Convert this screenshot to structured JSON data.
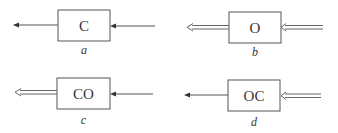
{
  "diagram": {
    "panels": [
      {
        "id": "a",
        "box_text": "C",
        "caption": "a",
        "output_arrow": "single",
        "input_arrow": "single"
      },
      {
        "id": "b",
        "box_text": "O",
        "caption": "b",
        "output_arrow": "double",
        "input_arrow": "double"
      },
      {
        "id": "c",
        "box_text": "CO",
        "caption": "c",
        "output_arrow": "double",
        "input_arrow": "single"
      },
      {
        "id": "d",
        "box_text": "OC",
        "caption": "d",
        "output_arrow": "single",
        "input_arrow": "double"
      }
    ],
    "colors": {
      "stroke": "#555555",
      "background": "#ffffff"
    }
  }
}
